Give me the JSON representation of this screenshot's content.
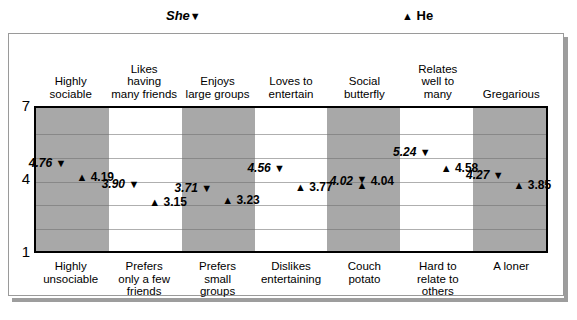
{
  "legend": {
    "she_label": "She",
    "she_glyph": "▼",
    "he_label": "He",
    "he_glyph": "▲"
  },
  "axis": {
    "tick_top": "7",
    "tick_mid": "4",
    "tick_bottom": "1"
  },
  "glyphs": {
    "down_triangle": "▼",
    "up_triangle": "▲"
  },
  "colors": {
    "band_shaded": "#a8a8a8",
    "band_plain": "#ffffff",
    "plot_border": "#000000",
    "gridline": "#6e6e6e",
    "card_border": "#9a9a9a",
    "card_shadow": "#9d9d9d"
  },
  "chart_data": {
    "type": "scatter",
    "title": "",
    "xlabel": "",
    "ylabel": "",
    "ylim": [
      1,
      7
    ],
    "yticks": [
      1,
      4,
      7
    ],
    "grid": true,
    "legend_position": "top",
    "categories": [
      "Highly sociable",
      "Likes having many friends",
      "Enjoys large groups",
      "Loves to entertain",
      "Social butterfly",
      "Relates well to many",
      "Gregarious"
    ],
    "categories_top": [
      "Highly\nsociable",
      "Likes\nhaving\nmany friends",
      "Enjoys\nlarge groups",
      "Loves to\nentertain",
      "Social\nbutterfly",
      "Relates\nwell to\nmany",
      "Gregarious"
    ],
    "categories_bottom": [
      "Highly\nunsociable",
      "Prefers\nonly a few\nfriends",
      "Prefers\nsmall\ngroups",
      "Dislikes\nentertaining",
      "Couch\npotato",
      "Hard to\nrelate to\nothers",
      "A loner"
    ],
    "series": [
      {
        "name": "She",
        "marker": "▼",
        "values": [
          4.76,
          3.9,
          3.71,
          4.56,
          4.02,
          5.24,
          4.27
        ],
        "labels": [
          "4.76",
          "3.90",
          "3.71",
          "4.56",
          "4.02",
          "5.24",
          "4.27"
        ]
      },
      {
        "name": "He",
        "marker": "▲",
        "values": [
          4.19,
          3.15,
          3.23,
          3.77,
          4.04,
          4.58,
          3.85
        ],
        "labels": [
          "4.19",
          "3.15",
          "3.23",
          "3.77",
          "4.04",
          "4.58",
          "3.85"
        ]
      }
    ],
    "band_shading": [
      "shaded",
      "plain",
      "shaded",
      "plain",
      "shaded",
      "plain",
      "shaded"
    ]
  }
}
